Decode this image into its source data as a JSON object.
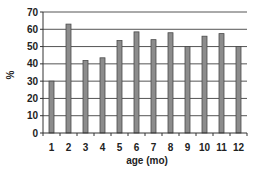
{
  "chart_data": {
    "type": "bar",
    "title": "",
    "xlabel": "age (mo)",
    "ylabel": "%",
    "categories": [
      "1",
      "2",
      "3",
      "4",
      "5",
      "6",
      "7",
      "8",
      "9",
      "10",
      "11",
      "12"
    ],
    "values": [
      30,
      63,
      42,
      43.5,
      53.5,
      58.5,
      54,
      58,
      50,
      56,
      57.5,
      50
    ],
    "ylim": [
      0,
      70
    ],
    "yticks": [
      0,
      10,
      20,
      30,
      40,
      50,
      60,
      70
    ],
    "grid": true,
    "legend": null,
    "colors": {
      "bar_fill": "#8c8c8c",
      "bar_stroke": "#4a4a4a",
      "grid": "#555555",
      "axis": "#333333"
    }
  }
}
